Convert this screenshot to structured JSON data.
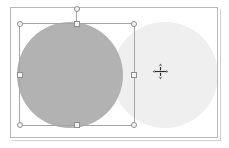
{
  "app": {
    "name": "slide-editor",
    "canvas_background": "#ffffff",
    "page_background": "#ffffff",
    "canvas_border_color": "#b9b9b9"
  },
  "canvas": {
    "name": "slide-canvas",
    "label": "Slide canvas"
  },
  "shapes": [
    {
      "name": "circle-right",
      "type": "ellipse",
      "label": "Ellipse 2",
      "fill": "#efefef",
      "selected": false,
      "x": 101,
      "y": 14,
      "width": 106,
      "height": 106
    },
    {
      "name": "circle-left",
      "type": "ellipse",
      "label": "Ellipse 1",
      "fill": "#b2b2b2",
      "selected": true,
      "x": 6,
      "y": 14,
      "width": 106,
      "height": 106
    }
  ],
  "selection": {
    "label": "Selection frame",
    "border_color": "#a6a6a6",
    "handle_fill": "#f4f4f4",
    "handle_border": "#8f8f8f",
    "x": 19,
    "y": 23,
    "width": 116,
    "height": 103,
    "handles": [
      {
        "name": "handle-top-left",
        "shape": "round",
        "label": "Resize top-left"
      },
      {
        "name": "handle-top-center",
        "shape": "square",
        "label": "Resize top"
      },
      {
        "name": "handle-top-right",
        "shape": "round",
        "label": "Resize top-right"
      },
      {
        "name": "handle-middle-left",
        "shape": "square",
        "label": "Resize left"
      },
      {
        "name": "handle-middle-right",
        "shape": "square",
        "label": "Resize right"
      },
      {
        "name": "handle-bottom-left",
        "shape": "round",
        "label": "Resize bottom-left"
      },
      {
        "name": "handle-bottom-center",
        "shape": "square",
        "label": "Resize bottom"
      },
      {
        "name": "handle-bottom-right",
        "shape": "round",
        "label": "Resize bottom-right"
      }
    ],
    "rotate_handle": {
      "name": "handle-rotate",
      "shape": "round",
      "label": "Rotate"
    }
  },
  "cursor": {
    "name": "move-cursor",
    "icon": "move-four-arrow-icon",
    "label": "Move",
    "x": 152,
    "y": 63,
    "color": "#2b2b2b"
  }
}
